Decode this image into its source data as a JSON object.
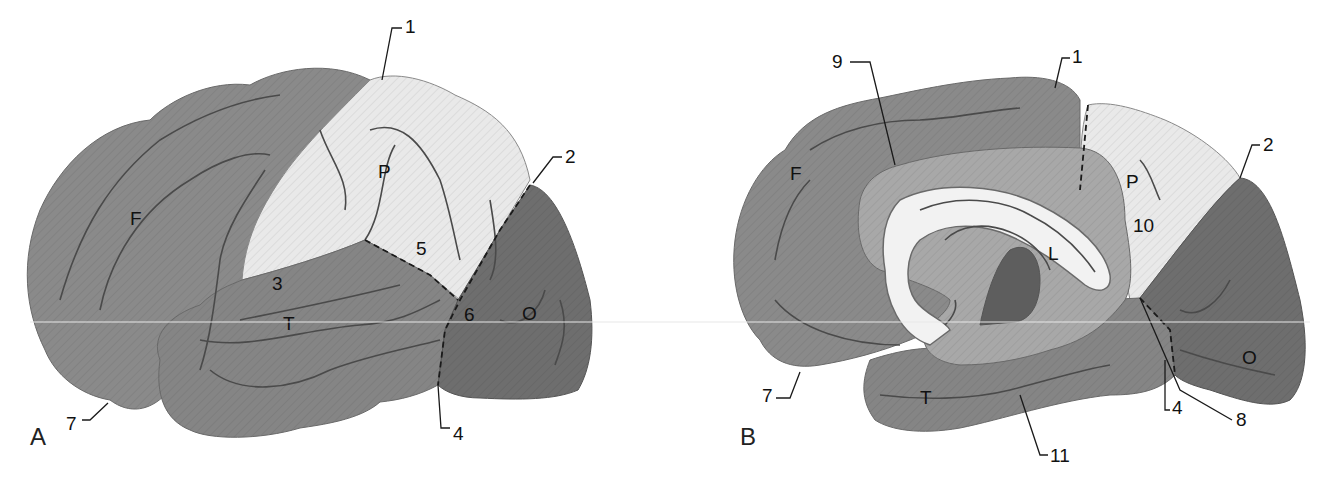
{
  "figure": {
    "type": "anatomical-diagram",
    "colors": {
      "frontal": "#8a8a8a",
      "parietal": "#e9e9e9",
      "temporal": "#858585",
      "occipital": "#6e6e6e",
      "limbic": "#a8a8a8",
      "corpus_callosum": "#f2f2f2",
      "thalamus": "#5e5e5e",
      "outline": "#5a5a5a",
      "text": "#111111"
    }
  },
  "panelA": {
    "panel_label": "A",
    "lobe_labels": {
      "frontal": "F",
      "parietal": "P",
      "temporal": "T",
      "occipital": "O"
    },
    "numbered_labels": {
      "n1": "1",
      "n2": "2",
      "n3": "3",
      "n4": "4",
      "n5": "5",
      "n6": "6",
      "n7": "7"
    }
  },
  "panelB": {
    "panel_label": "B",
    "lobe_labels": {
      "frontal": "F",
      "parietal": "P",
      "temporal": "T",
      "occipital": "O",
      "limbic": "L"
    },
    "numbered_labels": {
      "n1": "1",
      "n2": "2",
      "n4": "4",
      "n7": "7",
      "n8": "8",
      "n9": "9",
      "n10": "10",
      "n11": "11"
    }
  }
}
